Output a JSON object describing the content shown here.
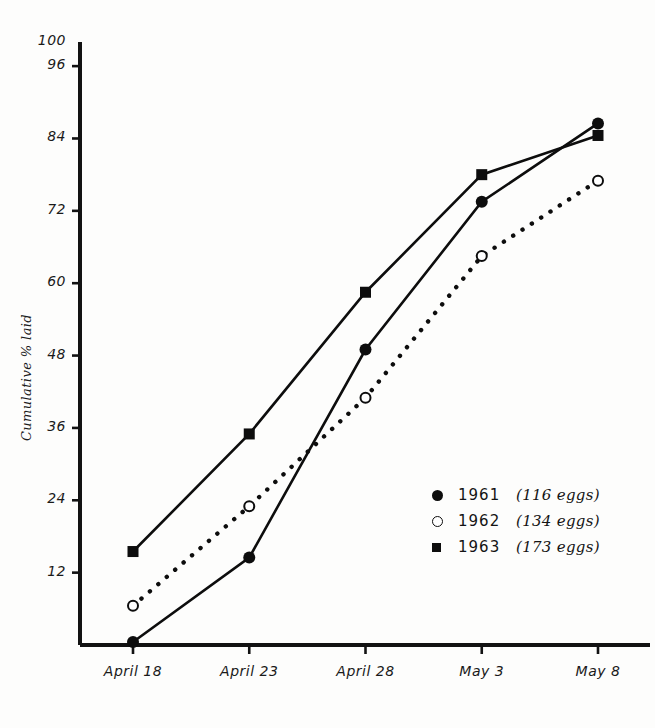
{
  "chart_data": {
    "type": "line",
    "title": "",
    "xlabel": "",
    "ylabel": "Cumulative % laid",
    "ylim": [
      0,
      100
    ],
    "grid": false,
    "legend_position": "middle-right",
    "categories": [
      "April 18",
      "April 23",
      "April 28",
      "May 3",
      "May 8"
    ],
    "x_tick_labels": [
      {
        "month": "April",
        "day": "18"
      },
      {
        "month": "April",
        "day": "23"
      },
      {
        "month": "April",
        "day": "28"
      },
      {
        "month": "May",
        "day": "3"
      },
      {
        "month": "May",
        "day": "8"
      }
    ],
    "y_tick_labels": [
      "100",
      "96",
      "84",
      "72",
      "60",
      "48",
      "36",
      "24",
      "12"
    ],
    "y_ticks": [
      100,
      96,
      84,
      72,
      60,
      48,
      36,
      24,
      12
    ],
    "series": [
      {
        "name": "1961",
        "legend_label": "1961",
        "legend_note": "(116 eggs)",
        "eggs": 116,
        "marker": "filled-circle",
        "line_style": "solid",
        "color": "#0d0d0d",
        "values": [
          0.5,
          14.5,
          49,
          73.5,
          86.5
        ]
      },
      {
        "name": "1962",
        "legend_label": "1962",
        "legend_note": "(134 eggs)",
        "eggs": 134,
        "marker": "open-circle",
        "line_style": "dotted",
        "color": "#0d0d0d",
        "values": [
          6.5,
          23,
          41,
          64.5,
          77
        ]
      },
      {
        "name": "1963",
        "legend_label": "1963",
        "legend_note": "(173 eggs)",
        "eggs": 173,
        "marker": "filled-square",
        "line_style": "solid",
        "color": "#0d0d0d",
        "values": [
          15.5,
          35,
          58.5,
          78,
          84.5
        ]
      }
    ]
  }
}
